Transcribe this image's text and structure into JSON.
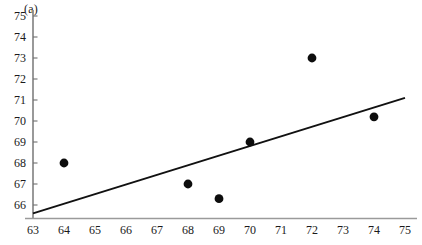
{
  "figure": {
    "panel_label": "(a)",
    "background_color": "#ffffff",
    "foreground_color": "#1a1a1a"
  },
  "chart_data": {
    "type": "scatter",
    "title": "",
    "subtitle": "",
    "xlabel": "",
    "ylabel": "",
    "annotations": [
      "(a)"
    ],
    "grid": false,
    "legend": null,
    "legend_position": "none",
    "xlim": [
      63,
      75
    ],
    "ylim": [
      65.4,
      75
    ],
    "xticks": [
      63,
      64,
      65,
      66,
      67,
      68,
      69,
      70,
      71,
      72,
      73,
      74,
      75
    ],
    "yticks": [
      66,
      67,
      68,
      69,
      70,
      71,
      72,
      73,
      74,
      75
    ],
    "xticklabels": [
      "63",
      "64",
      "65",
      "66",
      "67",
      "68",
      "69",
      "70",
      "71",
      "72",
      "73",
      "74",
      "75"
    ],
    "yticklabels": [
      "66",
      "67",
      "68",
      "69",
      "70",
      "71",
      "72",
      "73",
      "74",
      "75"
    ],
    "x": [
      64,
      68,
      69,
      70,
      72,
      74
    ],
    "y": [
      68,
      67,
      66.3,
      69,
      73,
      70.2
    ],
    "points": [
      {
        "x": 64,
        "y": 68
      },
      {
        "x": 68,
        "y": 67
      },
      {
        "x": 69,
        "y": 66.3
      },
      {
        "x": 70,
        "y": 69
      },
      {
        "x": 72,
        "y": 73
      },
      {
        "x": 74,
        "y": 70.2
      }
    ],
    "marker": "circle",
    "marker_color": "#0d0d0d",
    "marker_size": 4.4,
    "fit_line": {
      "label": "regression line",
      "color": "#111111",
      "x_start": 63,
      "y_start": 65.6,
      "x_end": 75,
      "y_end": 71.1,
      "slope": 0.458,
      "intercept": 36.75
    }
  }
}
